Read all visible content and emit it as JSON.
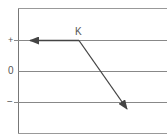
{
  "diagram": {
    "point_label": "K",
    "levels": [
      {
        "label": "+",
        "y": 40
      },
      {
        "label": "0",
        "y": 71
      },
      {
        "label": "−",
        "y": 102
      }
    ],
    "arrows": [
      {
        "name": "left-arrow",
        "from": "K",
        "direction": "left"
      },
      {
        "name": "diagonal-arrow",
        "from": "K",
        "direction": "down-right"
      }
    ],
    "colors": {
      "line": "#777777",
      "arrow": "#444444",
      "text": "#555555"
    }
  }
}
